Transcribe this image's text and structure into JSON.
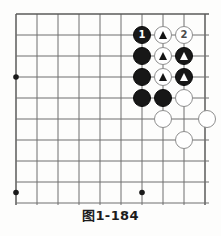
{
  "figure": {
    "caption": "图1-184",
    "kind": "go-board-diagram"
  },
  "board": {
    "origin_x": 16,
    "origin_y": 14,
    "spacing": 21,
    "cols": 10,
    "rows": 9,
    "line_color": "#6f6f6f",
    "edge_color": "#5a5a5a",
    "background": "#fdfdfc",
    "star_points": [
      {
        "col": 0,
        "row": 3,
        "name": "star-point-left"
      },
      {
        "col": 0,
        "row": 8.5,
        "name": "star-point-bottom-left"
      },
      {
        "col": 6,
        "row": 8.5,
        "name": "star-point-bottom-center"
      }
    ],
    "stone_radius": 9.2
  },
  "stones": [
    {
      "id": "black-1",
      "color": "black",
      "col": 6,
      "row": 1,
      "label": "1",
      "marker": "none",
      "name": "black-stone-move-1"
    },
    {
      "id": "white-t1",
      "color": "white",
      "col": 7,
      "row": 1,
      "label": "",
      "marker": "triangle-black",
      "name": "white-stone-marked-triangle"
    },
    {
      "id": "white-2",
      "color": "white",
      "col": 8,
      "row": 1,
      "label": "2",
      "marker": "none",
      "name": "white-stone-move-2"
    },
    {
      "id": "black-a",
      "color": "black",
      "col": 6,
      "row": 2,
      "label": "",
      "marker": "none",
      "name": "black-stone"
    },
    {
      "id": "white-t2",
      "color": "white",
      "col": 7,
      "row": 2,
      "label": "",
      "marker": "triangle-black",
      "name": "white-stone-marked-triangle"
    },
    {
      "id": "black-t1",
      "color": "black",
      "col": 8,
      "row": 2,
      "label": "",
      "marker": "triangle-white",
      "name": "black-stone-marked-triangle"
    },
    {
      "id": "black-b",
      "color": "black",
      "col": 6,
      "row": 3,
      "label": "",
      "marker": "none",
      "name": "black-stone"
    },
    {
      "id": "white-t3",
      "color": "white",
      "col": 7,
      "row": 3,
      "label": "",
      "marker": "triangle-black",
      "name": "white-stone-marked-triangle"
    },
    {
      "id": "black-t2",
      "color": "black",
      "col": 8,
      "row": 3,
      "label": "",
      "marker": "triangle-white",
      "name": "black-stone-marked-triangle"
    },
    {
      "id": "black-c",
      "color": "black",
      "col": 6,
      "row": 4,
      "label": "",
      "marker": "none",
      "name": "black-stone"
    },
    {
      "id": "black-d",
      "color": "black",
      "col": 7,
      "row": 4,
      "label": "",
      "marker": "none",
      "name": "black-stone"
    },
    {
      "id": "white-a",
      "color": "white",
      "col": 8,
      "row": 4,
      "label": "",
      "marker": "none",
      "name": "white-stone"
    },
    {
      "id": "white-b",
      "color": "white",
      "col": 7,
      "row": 5,
      "label": "",
      "marker": "none",
      "name": "white-stone"
    },
    {
      "id": "white-c",
      "color": "white",
      "col": 9.1,
      "row": 5,
      "label": "",
      "marker": "none",
      "name": "white-stone-edge"
    },
    {
      "id": "white-d",
      "color": "white",
      "col": 8,
      "row": 6,
      "label": "",
      "marker": "none",
      "name": "white-stone"
    }
  ]
}
